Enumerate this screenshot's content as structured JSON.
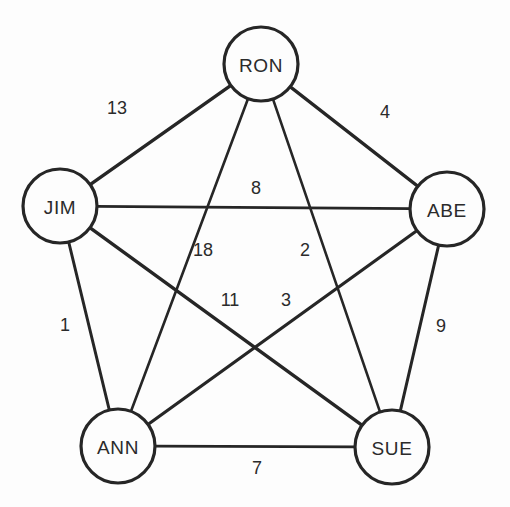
{
  "canvas": {
    "width": 510,
    "height": 507,
    "background": "#fdfdfd",
    "stroke_color": "#262626",
    "text_color": "#2b2b2b"
  },
  "chart_data": {
    "type": "diagram",
    "subtype": "weighted-undirected-graph",
    "title": "",
    "xlabel": "",
    "ylabel": "",
    "grid": false,
    "legend": false,
    "node_radius": 37,
    "nodes": [
      {
        "id": "RON",
        "label": "RON",
        "x": 261,
        "y": 64
      },
      {
        "id": "JIM",
        "label": "JIM",
        "x": 60,
        "y": 206
      },
      {
        "id": "ABE",
        "label": "ABE",
        "x": 447,
        "y": 209
      },
      {
        "id": "ANN",
        "label": "ANN",
        "x": 118,
        "y": 446
      },
      {
        "id": "SUE",
        "label": "SUE",
        "x": 392,
        "y": 447
      }
    ],
    "edges": [
      {
        "from": "JIM",
        "to": "RON",
        "weight": 13,
        "label": "13",
        "label_x": 117,
        "label_y": 108,
        "thickness": 3.4
      },
      {
        "from": "RON",
        "to": "ABE",
        "weight": 4,
        "label": "4",
        "label_x": 385,
        "label_y": 112,
        "thickness": 3.2
      },
      {
        "from": "JIM",
        "to": "ABE",
        "weight": 8,
        "label": "8",
        "label_x": 256,
        "label_y": 188,
        "thickness": 2.8
      },
      {
        "from": "RON",
        "to": "ANN",
        "weight": 18,
        "label": "18",
        "label_x": 203,
        "label_y": 250,
        "thickness": 2.6
      },
      {
        "from": "RON",
        "to": "SUE",
        "weight": 2,
        "label": "2",
        "label_x": 305,
        "label_y": 250,
        "thickness": 2.6
      },
      {
        "from": "JIM",
        "to": "SUE",
        "weight": 11,
        "label": "11",
        "label_x": 230,
        "label_y": 300,
        "thickness": 3.4
      },
      {
        "from": "ABE",
        "to": "ANN",
        "weight": 3,
        "label": "3",
        "label_x": 286,
        "label_y": 300,
        "thickness": 3.2
      },
      {
        "from": "JIM",
        "to": "ANN",
        "weight": 1,
        "label": "1",
        "label_x": 65,
        "label_y": 325,
        "thickness": 3.0
      },
      {
        "from": "ABE",
        "to": "SUE",
        "weight": 9,
        "label": "9",
        "label_x": 441,
        "label_y": 326,
        "thickness": 3.0
      },
      {
        "from": "ANN",
        "to": "SUE",
        "weight": 7,
        "label": "7",
        "label_x": 257,
        "label_y": 468,
        "thickness": 2.8
      }
    ]
  }
}
